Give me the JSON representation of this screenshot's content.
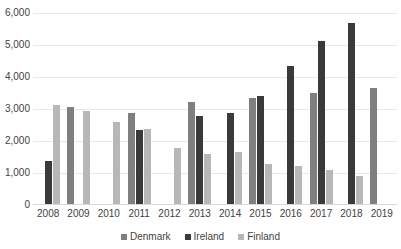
{
  "chart_data": {
    "type": "bar",
    "title": "",
    "subtitle": "",
    "xlabel": "",
    "ylabel": "",
    "ylim": [
      0,
      6000
    ],
    "y_ticks": [
      0,
      1000,
      2000,
      3000,
      4000,
      5000,
      6000
    ],
    "y_tick_labels": [
      "0",
      "1,000",
      "2,000",
      "3,000",
      "4,000",
      "5,000",
      "6,000"
    ],
    "grid": true,
    "legend_position": "bottom",
    "categories": [
      "2008",
      "2009",
      "2010",
      "2011",
      "2012",
      "2013",
      "2014",
      "2015",
      "2016",
      "2017",
      "2018",
      "2019"
    ],
    "series": [
      {
        "name": "Denmark",
        "color": "#7f7f7f",
        "values": [
          null,
          3050,
          null,
          2880,
          null,
          3230,
          null,
          3340,
          null,
          3500,
          null,
          3660
        ]
      },
      {
        "name": "Ireland",
        "color": "#3a3a3a",
        "values": [
          1370,
          null,
          null,
          2340,
          null,
          2790,
          2890,
          3410,
          4350,
          5130,
          5690,
          null
        ]
      },
      {
        "name": "Finland",
        "color": "#b7b7b7",
        "values": [
          3140,
          2940,
          2600,
          2370,
          1780,
          1590,
          1670,
          1270,
          1220,
          1080,
          900,
          null
        ]
      }
    ]
  },
  "legend": {
    "items": [
      {
        "label": "Denmark",
        "key": "denmark"
      },
      {
        "label": "Ireland",
        "key": "ireland"
      },
      {
        "label": "Finland",
        "key": "finland"
      }
    ]
  },
  "colors": {
    "denmark": "#7f7f7f",
    "ireland": "#3a3a3a",
    "finland": "#b7b7b7",
    "gridline": "#e8e8e8",
    "text": "#3f3f3f",
    "background": "#ffffff"
  }
}
